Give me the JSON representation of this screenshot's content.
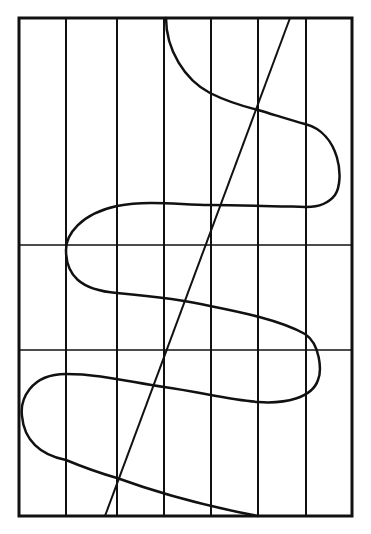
{
  "diagram": {
    "stroke_color": "#111111",
    "background": "#ffffff",
    "frame": {
      "x": 19,
      "y": 18,
      "width": 333,
      "height": 498
    },
    "vertical_lines_x": [
      66,
      117,
      164,
      211,
      258,
      306
    ],
    "horizontal_lines_y": [
      245,
      350
    ],
    "diagonal_line": {
      "x1": 290,
      "y1": 18,
      "x2": 105,
      "y2": 516
    },
    "serpentine_curve_path": "M166,18 C166,50 185,80 210,93 C230,103 250,108 258,110 C275,115 290,120 305,124 C340,133 345,180 335,195 C325,208 310,207 305,207 C270,206 240,205 210,205 C180,205 150,200 117,206 C80,214 66,235 66,250 C66,275 80,290 117,293 C150,296 185,300 210,306 C240,312 280,320 305,334 C320,344 322,370 318,380 C312,398 285,404 258,402 C230,400 200,392 164,387 C130,382 100,374 66,374 C30,374 20,400 22,416 C24,440 40,455 66,460 C90,470 110,476 117,478 C150,490 200,505 258,516"
  }
}
